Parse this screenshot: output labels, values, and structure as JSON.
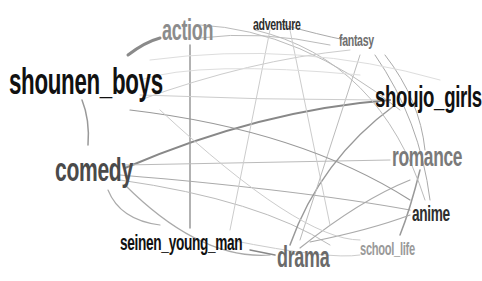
{
  "diagram": {
    "type": "network",
    "nodes": [
      {
        "id": "action",
        "label": "action",
        "x": 162,
        "y": 16,
        "size": 29,
        "color": "#8c8c8c"
      },
      {
        "id": "adventure",
        "label": "adventure",
        "x": 253,
        "y": 16,
        "size": 17,
        "color": "#2e2e2e"
      },
      {
        "id": "fantasy",
        "label": "fantasy",
        "x": 339,
        "y": 32,
        "size": 17,
        "color": "#6e6e6e"
      },
      {
        "id": "shounen_boys",
        "label": "shounen_boys",
        "x": 9,
        "y": 64,
        "size": 36,
        "color": "#111111"
      },
      {
        "id": "shoujo_girls",
        "label": "shoujo_girls",
        "x": 375,
        "y": 82,
        "size": 30,
        "color": "#111111"
      },
      {
        "id": "comedy",
        "label": "comedy",
        "x": 55,
        "y": 152,
        "size": 34,
        "color": "#4a4a4a"
      },
      {
        "id": "romance",
        "label": "romance",
        "x": 392,
        "y": 143,
        "size": 28,
        "color": "#7a7a7a"
      },
      {
        "id": "anime",
        "label": "anime",
        "x": 412,
        "y": 203,
        "size": 22,
        "color": "#2e2e2e"
      },
      {
        "id": "seinen_young_man",
        "label": "seinen_young_man",
        "x": 120,
        "y": 232,
        "size": 22,
        "color": "#111111"
      },
      {
        "id": "drama",
        "label": "drama",
        "x": 277,
        "y": 243,
        "size": 29,
        "color": "#6a6a6a"
      },
      {
        "id": "school_life",
        "label": "school_life",
        "x": 360,
        "y": 240,
        "size": 18,
        "color": "#9a9a9a"
      }
    ],
    "edges": [
      {
        "d": "M128,55 Q145,42 160,38",
        "w": 3,
        "c": "#8a8a8a"
      },
      {
        "d": "M82,100 Q90,120 88,145",
        "w": 1.5,
        "c": "#999999"
      },
      {
        "d": "M125,168 Q260,110 390,100",
        "w": 2,
        "c": "#888888"
      },
      {
        "d": "M190,45 L190,228",
        "w": 1.5,
        "c": "#999999"
      },
      {
        "d": "M125,185 Q200,260 270,255",
        "w": 1.2,
        "c": "#aaaaaa"
      },
      {
        "d": "M250,250 L275,255",
        "w": 1.5,
        "c": "#888888"
      },
      {
        "d": "M120,175 Q300,190 410,210",
        "w": 1.2,
        "c": "#aaaaaa"
      },
      {
        "d": "M125,165 L390,160",
        "w": 1,
        "c": "#bbbbbb"
      },
      {
        "d": "M120,180 Q260,200 330,245",
        "w": 1,
        "c": "#bbbbbb"
      },
      {
        "d": "M108,190 Q120,220 160,225",
        "w": 1.2,
        "c": "#aaaaaa"
      },
      {
        "d": "M290,245 Q320,160 395,105",
        "w": 1.5,
        "c": "#999999"
      },
      {
        "d": "M300,248 Q360,200 410,180",
        "w": 1.2,
        "c": "#aaaaaa"
      },
      {
        "d": "M400,235 Q410,210 420,170",
        "w": 1.5,
        "c": "#999999"
      },
      {
        "d": "M310,242 Q370,230 410,215",
        "w": 1.2,
        "c": "#aaaaaa"
      },
      {
        "d": "M200,25 Q300,30 400,110",
        "w": 1,
        "c": "#bbbbbb"
      },
      {
        "d": "M255,30 Q380,60 425,200",
        "w": 1,
        "c": "#bbbbbb"
      },
      {
        "d": "M280,24 Q320,35 345,40",
        "w": 1,
        "c": "#aaaaaa"
      },
      {
        "d": "M200,38 Q260,30 330,45",
        "w": 1,
        "c": "#bbbbbb"
      },
      {
        "d": "M140,100 Q250,60 350,50",
        "w": 1,
        "c": "#cccccc"
      },
      {
        "d": "M270,30 L230,230",
        "w": 1,
        "c": "#cccccc"
      },
      {
        "d": "M290,30 L330,225",
        "w": 1,
        "c": "#cccccc"
      },
      {
        "d": "M360,55 L300,240",
        "w": 1,
        "c": "#bbbbbb"
      },
      {
        "d": "M375,55 Q420,120 430,200",
        "w": 1,
        "c": "#aaaaaa"
      },
      {
        "d": "M385,55 Q420,100 425,150",
        "w": 1,
        "c": "#aaaaaa"
      },
      {
        "d": "M130,110 Q300,130 410,200",
        "w": 1.2,
        "c": "#999999"
      },
      {
        "d": "M140,95 Q260,100 380,100",
        "w": 1,
        "c": "#cccccc"
      },
      {
        "d": "M150,60 Q300,40 440,80",
        "w": 1,
        "c": "#dddddd"
      },
      {
        "d": "M160,110 Q300,240 360,240",
        "w": 1,
        "c": "#cccccc"
      },
      {
        "d": "M230,240 Q330,260 360,255",
        "w": 1,
        "c": "#cccccc"
      },
      {
        "d": "M140,80 Q200,60 360,75",
        "w": 1,
        "c": "#dddddd"
      }
    ]
  }
}
